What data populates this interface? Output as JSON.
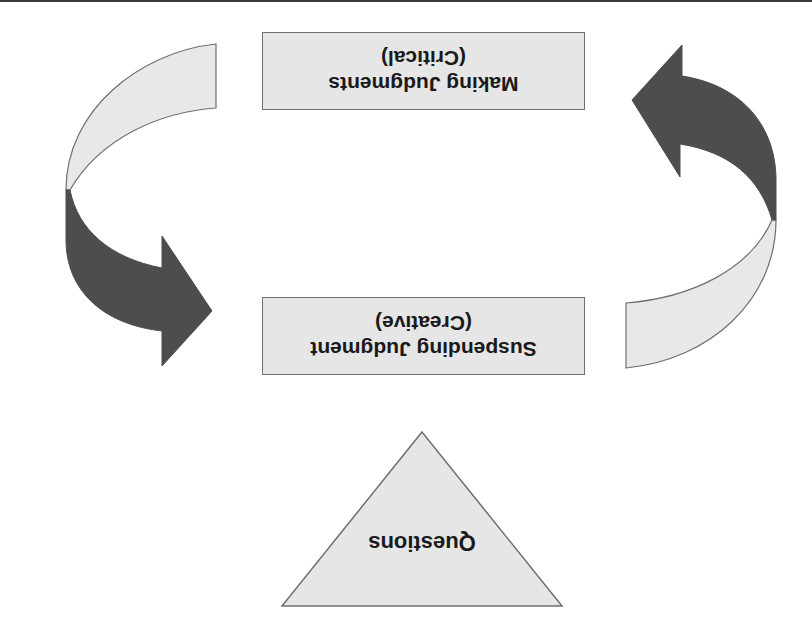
{
  "diagram": {
    "orientation": "rotated 180 degrees",
    "boxes": [
      {
        "id": "making-judgments",
        "line1": "Making Judgments",
        "line2": "(Critical)"
      },
      {
        "id": "suspending-judgment",
        "line1": "Suspending Judgment",
        "line2": "(Creative)"
      }
    ],
    "triangle": {
      "label": "Questions"
    },
    "arrows": [
      {
        "id": "left-arrow",
        "from": "Making Judgments",
        "to": "Suspending Judgment"
      },
      {
        "id": "right-arrow",
        "from": "Suspending Judgment",
        "to": "Making Judgments"
      }
    ],
    "colors": {
      "box_fill": "#e6e6e6",
      "box_border": "#6f6f6f",
      "arrow_light": "#e8e8e8",
      "arrow_dark": "#4d4d4d",
      "text": "#1a1a1a"
    }
  }
}
